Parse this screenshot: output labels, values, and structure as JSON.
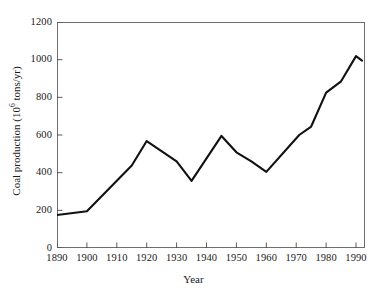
{
  "chart_data": {
    "type": "line",
    "title": "",
    "xlabel": "Year",
    "ylabel_parts": {
      "before": "Coal production (10",
      "exponent": "6",
      "after": " tons/yr)"
    },
    "ylabel": "Coal production (10^6 tons/yr)",
    "xlim": [
      1890,
      1993
    ],
    "ylim": [
      0,
      1200
    ],
    "xticks": [
      1890,
      1900,
      1910,
      1920,
      1930,
      1940,
      1950,
      1960,
      1970,
      1980,
      1990
    ],
    "xtick_labels": [
      "1890",
      "1900",
      "1910",
      "1920",
      "1930",
      "1940",
      "1950",
      "1960",
      "1970",
      "1980",
      "1990"
    ],
    "yticks": [
      0,
      200,
      400,
      600,
      800,
      1000,
      1200
    ],
    "ytick_labels": [
      "0",
      "200",
      "400",
      "600",
      "800",
      "1000",
      "1200"
    ],
    "grid": false,
    "legend": "none",
    "line_color": "#111111",
    "line_width": 2.1,
    "background": "#ffffff",
    "frame_color": "#6d6d6d",
    "x": [
      1890,
      1900,
      1915,
      1920,
      1930,
      1935,
      1945,
      1950,
      1955,
      1960,
      1971,
      1975,
      1980,
      1985,
      1990,
      1992
    ],
    "values": [
      175,
      195,
      438,
      568,
      460,
      356,
      595,
      508,
      460,
      404,
      600,
      645,
      825,
      885,
      1019,
      995
    ],
    "series": [
      {
        "name": "Coal production",
        "points": [
          {
            "x": 1890,
            "y": 175
          },
          {
            "x": 1900,
            "y": 195
          },
          {
            "x": 1915,
            "y": 438
          },
          {
            "x": 1920,
            "y": 568
          },
          {
            "x": 1930,
            "y": 460
          },
          {
            "x": 1935,
            "y": 356
          },
          {
            "x": 1945,
            "y": 595
          },
          {
            "x": 1950,
            "y": 508
          },
          {
            "x": 1955,
            "y": 460
          },
          {
            "x": 1960,
            "y": 404
          },
          {
            "x": 1971,
            "y": 600
          },
          {
            "x": 1975,
            "y": 645
          },
          {
            "x": 1980,
            "y": 825
          },
          {
            "x": 1985,
            "y": 885
          },
          {
            "x": 1990,
            "y": 1019
          },
          {
            "x": 1992,
            "y": 995
          }
        ]
      }
    ]
  }
}
